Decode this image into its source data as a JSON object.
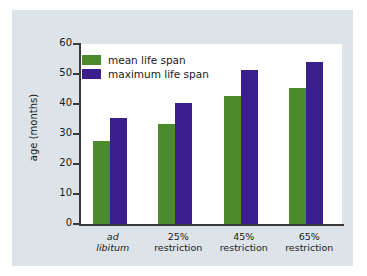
{
  "chart_data": {
    "type": "bar",
    "title": "",
    "subtitle": "",
    "xlabel": "",
    "ylabel": "age (months)",
    "ylim": [
      0,
      60
    ],
    "yticks": [
      0,
      10,
      20,
      30,
      40,
      50,
      60
    ],
    "ytick_labels": [
      "0",
      "10",
      "20",
      "30",
      "40",
      "50",
      "60"
    ],
    "grid": false,
    "legend_position": "top-left",
    "categories": [
      "ad\nlibitum",
      "25%\nrestriction",
      "45%\nrestriction",
      "65%\nrestriction"
    ],
    "category_styles": [
      "italic",
      "normal",
      "normal",
      "normal"
    ],
    "series": [
      {
        "name": "mean life span",
        "color": "#4b8b2b",
        "values": [
          27.8,
          33.2,
          42.6,
          45.4
        ]
      },
      {
        "name": "maximum life span",
        "color": "#3a1f8c",
        "values": [
          35.4,
          40.2,
          51.5,
          54.0
        ]
      }
    ]
  },
  "legend": {
    "items": [
      {
        "label": "mean life span",
        "color": "#4b8b2b"
      },
      {
        "label": "maximum life span",
        "color": "#3a1f8c"
      }
    ]
  },
  "axis": {
    "y_title": "age (months)",
    "y_labels": [
      "60",
      "50",
      "40",
      "30",
      "20",
      "10",
      "0"
    ]
  },
  "categories": [
    {
      "line1": "ad",
      "line2": "libitum",
      "style": "italic"
    },
    {
      "line1": "25%",
      "line2": "restriction",
      "style": "normal"
    },
    {
      "line1": "45%",
      "line2": "restriction",
      "style": "normal"
    },
    {
      "line1": "65%",
      "line2": "restriction",
      "style": "normal"
    }
  ],
  "colors": {
    "panel_background": "#dce4ea",
    "plot_background": "#ffffff",
    "axis": "#3a3a3a",
    "mean_bar": "#4b8b2b",
    "max_bar": "#3a1f8c",
    "text": "#1a1a1a"
  }
}
